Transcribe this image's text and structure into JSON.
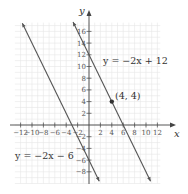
{
  "chart_data": {
    "type": "line",
    "title": "",
    "xlabel": "x",
    "ylabel": "y",
    "xlim": [
      -14,
      14
    ],
    "ylim": [
      -10,
      18
    ],
    "grid": true,
    "x_ticks": [
      -12,
      -10,
      -8,
      -6,
      -4,
      -2,
      2,
      4,
      6,
      8,
      10,
      12
    ],
    "y_ticks": [
      -8,
      -6,
      -4,
      -2,
      2,
      4,
      6,
      8,
      10,
      12,
      14,
      16
    ],
    "series": [
      {
        "name": "y = −2x + 12",
        "slope": -2,
        "intercept": 12,
        "x_range": [
          -2.8,
          10.8
        ],
        "label_pos": [
          8,
          11.5
        ]
      },
      {
        "name": "y = −2x − 6",
        "slope": -2,
        "intercept": -6,
        "x_range": [
          -11.7,
          1.8
        ],
        "label_pos": [
          -5.5,
          -5
        ]
      }
    ],
    "points": [
      {
        "x": 4,
        "y": 4,
        "label": "(4, 4)"
      }
    ]
  },
  "labels": {
    "x_axis": "x",
    "y_axis": "y",
    "eq1": "y = −2x + 12",
    "eq2": "y = −2x − 6",
    "point": "(4, 4)"
  }
}
